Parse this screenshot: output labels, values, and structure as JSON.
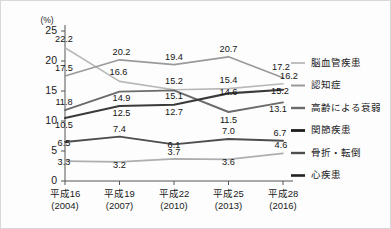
{
  "chart_data": {
    "type": "line",
    "title": "",
    "subtitle": "",
    "xlabel": "",
    "ylabel": "(%)",
    "unit_label": "(%)",
    "ylim": [
      0,
      25
    ],
    "yticks": [
      0,
      5,
      10,
      15,
      20,
      25
    ],
    "ytick_labels": [
      "0",
      "5",
      "10",
      "15",
      "20",
      "25"
    ],
    "grid": false,
    "legend_position": "right",
    "categories": [
      "平成16\n(2004)",
      "平成19\n(2007)",
      "平成22\n(2010)",
      "平成25\n(2013)",
      "平成28\n(2016)"
    ],
    "category_lines": [
      [
        "平成16",
        "(2004)"
      ],
      [
        "平成19",
        "(2007)"
      ],
      [
        "平成22",
        "(2010)"
      ],
      [
        "平成25",
        "(2013)"
      ],
      [
        "平成28",
        "(2016)"
      ]
    ],
    "series": [
      {
        "name": "脳血管疾患",
        "color": "#b8b8b8",
        "width": 1.6,
        "values": [
          22.2,
          16.6,
          15.2,
          15.4,
          16.2
        ],
        "labels": [
          "22.2",
          "16.6",
          "15.2",
          "15.4",
          "16.2"
        ],
        "label_offsets": [
          [
            -1,
            -6
          ],
          [
            -1,
            -6
          ],
          [
            0,
            -6
          ],
          [
            0,
            -6
          ],
          [
            6,
            -5
          ]
        ]
      },
      {
        "name": "認知症",
        "color": "#9a9a9a",
        "width": 1.7,
        "values": [
          17.5,
          20.2,
          19.4,
          20.7,
          17.2
        ],
        "labels": [
          "17.5",
          "20.2",
          "19.4",
          "20.7",
          "17.2"
        ],
        "label_offsets": [
          [
            -1,
            -5
          ],
          [
            2,
            -5
          ],
          [
            0,
            -5
          ],
          [
            0,
            -5
          ],
          [
            -2,
            -8
          ]
        ]
      },
      {
        "name": "高齢による衰弱",
        "color": "#6b6b6b",
        "width": 1.9,
        "values": [
          11.8,
          14.9,
          15.1,
          11.5,
          13.1
        ],
        "labels": [
          "11.8",
          "14.9",
          "15.1",
          "11.5",
          "13.1"
        ],
        "label_offsets": [
          [
            -1,
            -5
          ],
          [
            2,
            9
          ],
          [
            0,
            9
          ],
          [
            0,
            11
          ],
          [
            -5,
            10
          ]
        ]
      },
      {
        "name": "関節疾患",
        "color": "#3a3a3a",
        "width": 2.1,
        "values": [
          10.5,
          12.5,
          12.7,
          14.6,
          15.2
        ],
        "labels": [
          "10.5",
          "12.5",
          "12.7",
          "14.6",
          "15.2"
        ],
        "label_offsets": [
          [
            -1,
            10
          ],
          [
            2,
            10
          ],
          [
            0,
            10
          ],
          [
            0,
            2
          ],
          [
            -3,
            4
          ]
        ]
      },
      {
        "name": "骨折・転倒",
        "color": "#4d4d4d",
        "width": 1.9,
        "values": [
          6.5,
          7.4,
          6.1,
          7.0,
          6.7
        ],
        "labels": [
          "6.5",
          "7.4",
          "6.1",
          "7.0",
          "6.7"
        ],
        "label_offsets": [
          [
            -1,
            4
          ],
          [
            0,
            -5
          ],
          [
            0,
            4
          ],
          [
            0,
            -5
          ],
          [
            -3,
            -5
          ]
        ]
      },
      {
        "name": "心疾患",
        "color": "#aeaeae",
        "width": 1.7,
        "values": [
          3.3,
          3.2,
          3.7,
          3.6,
          4.6
        ],
        "labels": [
          "3.3",
          "3.2",
          "3.7",
          "3.6",
          "4.6"
        ],
        "label_offsets": [
          [
            -1,
            4
          ],
          [
            0,
            6
          ],
          [
            0,
            -4
          ],
          [
            0,
            6
          ],
          [
            -2,
            -5
          ]
        ]
      }
    ]
  },
  "legend": {
    "entries": [
      {
        "label": "脳血管疾患",
        "color": "#b8b8b8",
        "width": 1.8
      },
      {
        "label": "認知症",
        "color": "#9a9a9a",
        "width": 2.0
      },
      {
        "label": "高齢による衰弱",
        "color": "#6b6b6b",
        "width": 2.4
      },
      {
        "label": "関節疾患",
        "color": "#1e1e1e",
        "width": 2.8
      },
      {
        "label": "骨折・転倒",
        "color": "#4d4d4d",
        "width": 2.4
      },
      {
        "label": "心疾患",
        "color": "#222222",
        "width": 2.6
      }
    ]
  }
}
